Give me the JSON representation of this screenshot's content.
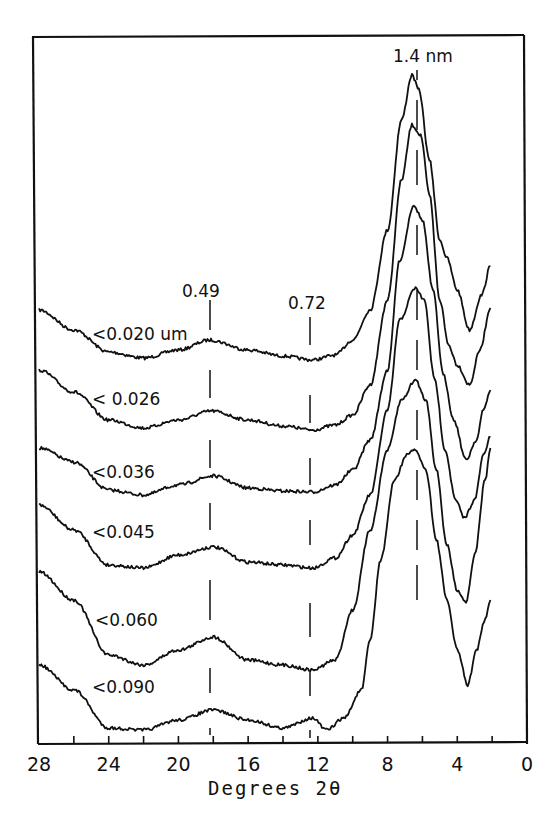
{
  "chart_data": {
    "type": "line",
    "title": "",
    "xlabel": "Degrees 2θ",
    "ylabel": "",
    "x_reversed": true,
    "xlim": [
      28,
      0
    ],
    "xticks": [
      28,
      24,
      20,
      16,
      12,
      8,
      4,
      0
    ],
    "xticks_minor": [
      26,
      22,
      18,
      14,
      10,
      6,
      2
    ],
    "grid": false,
    "legend": "inline labels on curves",
    "annotations": [
      {
        "text": "1.4 nm",
        "x_deg": 6.3,
        "style": "dashed vertical line"
      },
      {
        "text": "0.49",
        "x_deg": 18.1,
        "style": "dashed vertical line"
      },
      {
        "text": "0.72",
        "x_deg": 12.3,
        "style": "dashed vertical line"
      }
    ],
    "series": [
      {
        "name": "<0.020 um",
        "points_deg_y": [
          [
            28,
            310
          ],
          [
            26,
            330
          ],
          [
            24,
            352
          ],
          [
            22,
            358
          ],
          [
            20,
            350
          ],
          [
            18.2,
            340
          ],
          [
            16,
            350
          ],
          [
            14,
            356
          ],
          [
            12.3,
            360
          ],
          [
            11,
            355
          ],
          [
            10,
            340
          ],
          [
            9,
            310
          ],
          [
            8,
            230
          ],
          [
            7.2,
            120
          ],
          [
            6.6,
            75
          ],
          [
            6.2,
            90
          ],
          [
            5.6,
            160
          ],
          [
            5,
            240
          ],
          [
            4.6,
            258
          ],
          [
            4,
            290
          ],
          [
            3.3,
            330
          ],
          [
            2.6,
            295
          ],
          [
            2.1,
            266
          ]
        ]
      },
      {
        "name": "<0.026",
        "points_deg_y": [
          [
            28,
            370
          ],
          [
            26,
            392
          ],
          [
            24,
            420
          ],
          [
            22,
            428
          ],
          [
            20,
            420
          ],
          [
            18.1,
            411
          ],
          [
            16,
            420
          ],
          [
            14,
            426
          ],
          [
            12.3,
            430
          ],
          [
            11,
            425
          ],
          [
            10,
            415
          ],
          [
            9,
            385
          ],
          [
            8,
            300
          ],
          [
            7.2,
            180
          ],
          [
            6.6,
            125
          ],
          [
            6.1,
            135
          ],
          [
            5.6,
            195
          ],
          [
            5,
            300
          ],
          [
            4.5,
            345
          ],
          [
            4,
            365
          ],
          [
            3.3,
            385
          ],
          [
            2.7,
            350
          ],
          [
            2.1,
            308
          ]
        ]
      },
      {
        "name": "<0.036",
        "points_deg_y": [
          [
            28,
            448
          ],
          [
            26,
            462
          ],
          [
            24,
            490
          ],
          [
            22,
            495
          ],
          [
            20,
            485
          ],
          [
            18,
            476
          ],
          [
            16,
            488
          ],
          [
            14,
            491
          ],
          [
            12.3,
            492
          ],
          [
            11,
            485
          ],
          [
            10,
            470
          ],
          [
            9,
            440
          ],
          [
            8,
            370
          ],
          [
            7.3,
            260
          ],
          [
            6.5,
            205
          ],
          [
            6,
            220
          ],
          [
            5.4,
            290
          ],
          [
            4.8,
            375
          ],
          [
            4.2,
            420
          ],
          [
            3.5,
            460
          ],
          [
            2.9,
            440
          ],
          [
            2.5,
            410
          ],
          [
            2.1,
            390
          ]
        ]
      },
      {
        "name": "<0.045",
        "points_deg_y": [
          [
            28,
            505
          ],
          [
            26,
            530
          ],
          [
            24,
            565
          ],
          [
            22,
            568
          ],
          [
            20,
            555
          ],
          [
            18,
            547
          ],
          [
            16,
            562
          ],
          [
            14,
            565
          ],
          [
            12.3,
            568
          ],
          [
            11,
            558
          ],
          [
            10,
            535
          ],
          [
            9,
            495
          ],
          [
            8,
            410
          ],
          [
            7.3,
            320
          ],
          [
            6.4,
            288
          ],
          [
            5.9,
            300
          ],
          [
            5.3,
            380
          ],
          [
            4.7,
            450
          ],
          [
            4.1,
            500
          ],
          [
            3.6,
            518
          ],
          [
            3,
            500
          ],
          [
            2.5,
            455
          ],
          [
            2.1,
            437
          ]
        ]
      },
      {
        "name": "<0.060",
        "points_deg_y": [
          [
            28,
            572
          ],
          [
            26,
            600
          ],
          [
            24,
            655
          ],
          [
            22,
            665
          ],
          [
            20,
            650
          ],
          [
            18,
            637
          ],
          [
            16,
            660
          ],
          [
            14,
            665
          ],
          [
            12.3,
            670
          ],
          [
            11,
            660
          ],
          [
            10,
            610
          ],
          [
            9,
            530
          ],
          [
            8,
            450
          ],
          [
            7.2,
            400
          ],
          [
            6.4,
            380
          ],
          [
            5.8,
            400
          ],
          [
            5.2,
            470
          ],
          [
            4.6,
            545
          ],
          [
            4,
            590
          ],
          [
            3.5,
            602
          ],
          [
            3,
            555
          ],
          [
            2.4,
            480
          ],
          [
            2.1,
            448
          ]
        ]
      },
      {
        "name": "<0.090",
        "points_deg_y": [
          [
            28,
            665
          ],
          [
            26,
            690
          ],
          [
            24,
            728
          ],
          [
            22,
            730
          ],
          [
            20,
            720
          ],
          [
            18,
            710
          ],
          [
            16,
            720
          ],
          [
            14,
            728
          ],
          [
            12.3,
            718
          ],
          [
            11.5,
            730
          ],
          [
            10.5,
            718
          ],
          [
            9.5,
            690
          ],
          [
            9,
            640
          ],
          [
            8.4,
            560
          ],
          [
            7.6,
            480
          ],
          [
            6.9,
            455
          ],
          [
            6.4,
            450
          ],
          [
            5.8,
            470
          ],
          [
            5.2,
            540
          ],
          [
            4.6,
            600
          ],
          [
            4,
            650
          ],
          [
            3.4,
            685
          ],
          [
            2.9,
            650
          ],
          [
            2.4,
            620
          ],
          [
            2.1,
            600
          ]
        ]
      }
    ],
    "series_labels": [
      {
        "text": "<0.020 um",
        "x": 92,
        "y": 340
      },
      {
        "text": "< 0.026",
        "x": 92,
        "y": 405
      },
      {
        "text": "<0.036",
        "x": 92,
        "y": 478
      },
      {
        "text": "<0.045",
        "x": 92,
        "y": 538
      },
      {
        "text": "<0.060",
        "x": 95,
        "y": 626
      },
      {
        "text": "<0.090",
        "x": 92,
        "y": 693
      }
    ]
  },
  "axis": {
    "x_title": "Degrees  2θ"
  },
  "peak_labels": {
    "nm_14": "1.4 nm",
    "nm_049": "0.49",
    "nm_072": "0.72"
  },
  "colors": {
    "ink": "#111111",
    "background": "#ffffff"
  }
}
